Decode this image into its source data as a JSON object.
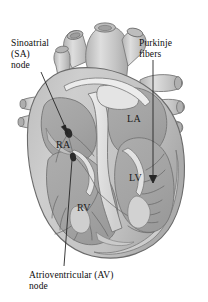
{
  "figure": {
    "background_color": "#ffffff",
    "width": 208,
    "height": 302
  },
  "callouts": [
    {
      "id": "sa-node",
      "lines": [
        "Sinoatrial",
        "(SA)",
        "node"
      ],
      "text": "Sinoatrial\n(SA)\nnode"
    },
    {
      "id": "purkinje-fibers",
      "lines": [
        "Purkinje",
        "fibers"
      ],
      "text": "Purkinje\nfibers"
    },
    {
      "id": "av-node",
      "lines": [
        "Atrioventricular (AV)",
        "node"
      ],
      "text": "Atrioventricular (AV)\nnode"
    }
  ],
  "chamber_labels": [
    {
      "id": "right-atrium",
      "text": "RA"
    },
    {
      "id": "left-atrium",
      "text": "LA"
    },
    {
      "id": "left-ventricle",
      "text": "LV"
    },
    {
      "id": "right-ventricle",
      "text": "RV"
    }
  ],
  "colors": {
    "background": "#ffffff",
    "myocardium_light": "#c9c9c9",
    "myocardium_mid": "#bcbcbc",
    "chamber_fill": "#a9a9a9",
    "chamber_shadow": "#9a9a9a",
    "septum_light": "#e6e6e6",
    "vessel_fill": "#c6c6c6",
    "vessel_highlight": "#dcdcdc",
    "outline": "#6f6f6f",
    "outline_dark": "#4a4a4a",
    "node_dot": "#2a2a2a",
    "leader_line": "#2b2b2b",
    "text": "#0d0d0d"
  }
}
